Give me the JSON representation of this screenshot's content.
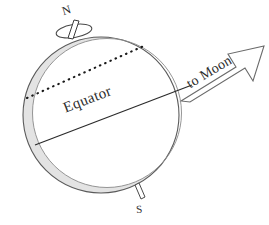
{
  "figure": {
    "type": "diagram",
    "background_color": "#ffffff"
  },
  "labels": {
    "north_pole": "N",
    "south_pole": "S",
    "equator": "Equator",
    "to_moon": "to Moon"
  },
  "colors": {
    "outline": "#5a5a5a",
    "bulge_fill": "#e3e3e3",
    "line": "#2b2b2b",
    "text": "#2b2b2b",
    "arrow_outline": "#6a6a6a"
  },
  "geometry": {
    "earth_center": {
      "x": 101,
      "y": 115
    },
    "earth_radius": 78,
    "bulge_offset": {
      "x": 6,
      "y": -2
    },
    "axis_tilt_degrees": 21,
    "moon_direction_degrees": 31,
    "equator_line": {
      "x1": 35,
      "y1": 145,
      "x2": 192,
      "y2": 85
    },
    "dotted_line": {
      "x1": 27,
      "y1": 98,
      "x2": 146,
      "y2": 45
    }
  }
}
